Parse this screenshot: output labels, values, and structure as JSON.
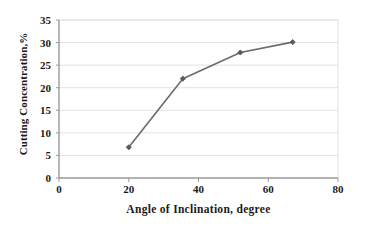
{
  "chart_data": {
    "type": "line",
    "title": "",
    "xlabel": "Angle of Inclination, degree",
    "ylabel": "Cutting Concentration,%",
    "xlim": [
      0,
      80
    ],
    "ylim": [
      0,
      35
    ],
    "xticks": [
      0,
      20,
      40,
      60,
      80
    ],
    "yticks": [
      0,
      5,
      10,
      15,
      20,
      25,
      30,
      35
    ],
    "grid": "horizontal",
    "legend": "none",
    "series": [
      {
        "name": "Cutting Concentration",
        "color": "#6b6b6b",
        "marker": "diamond",
        "x": [
          20,
          35.5,
          52,
          67
        ],
        "y": [
          6.8,
          22.0,
          27.8,
          30.1
        ]
      }
    ]
  },
  "axes": {
    "x_title": "Angle of Inclination, degree",
    "y_title": "Cutting Concentration,%",
    "x_tick_labels": [
      "0",
      "20",
      "40",
      "60",
      "80"
    ],
    "y_tick_labels": [
      "0",
      "5",
      "10",
      "15",
      "20",
      "25",
      "30",
      "35"
    ]
  },
  "style": {
    "line_color": "#6b6b6b",
    "marker_color": "#5a5a5a",
    "grid_color": "#e2e2e2",
    "axis_color": "#9a9a9a",
    "text_color": "#1a1a1a",
    "background": "#ffffff"
  }
}
